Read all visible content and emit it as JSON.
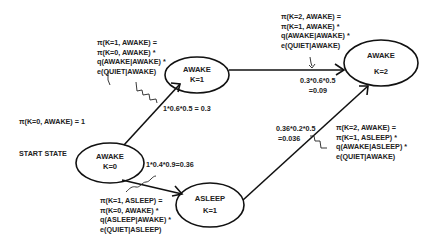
{
  "diagram": {
    "type": "hmm-trellis",
    "nodes": [
      {
        "id": "awake_k0",
        "state": "AWAKE",
        "step": "K=0"
      },
      {
        "id": "awake_k1",
        "state": "AWAKE",
        "step": "K=1"
      },
      {
        "id": "asleep_k1",
        "state": "ASLEEP",
        "step": "K=1"
      },
      {
        "id": "awake_k2",
        "state": "AWAKE",
        "step": "K=2"
      }
    ],
    "start": {
      "init_formula": "π(K=0, AWAKE) = 1",
      "label": "START STATE"
    },
    "edges": [
      {
        "from": "awake_k0",
        "to": "awake_k1",
        "value": "1*0.6*0.5 = 0.3"
      },
      {
        "from": "awake_k0",
        "to": "asleep_k1",
        "value": "1*0.4*0.9=0.36"
      },
      {
        "from": "awake_k1",
        "to": "awake_k2",
        "value_line1": "0.3*0.6*0.5",
        "value_line2": "=0.09"
      },
      {
        "from": "asleep_k1",
        "to": "awake_k2",
        "value_line1": "0.36*0.2*0.5",
        "value_line2": "=0.036"
      }
    ],
    "annotations": {
      "awake_k1": [
        "π(K=1, AWAKE) =",
        "π(K=0, AWAKE) *",
        "q(AWAKE|AWAKE) *",
        "e(QUIET|AWAKE)"
      ],
      "awake_k2_from_awake": [
        "π(K=2, AWAKE) =",
        "π(K=1, AWAKE) *",
        "q(AWAKE|AWAKE) *",
        "e(QUIET|AWAKE)"
      ],
      "asleep_k1": [
        "π(K=1, ASLEEP) =",
        "π(K=0, AWAKE) *",
        "q(ASLEEP|AWAKE) *",
        "e(QUIET|ASLEEP)"
      ],
      "awake_k2_from_asleep": [
        "π(K=2, AWAKE) =",
        "π(K=1, ASLEEP) *",
        "q(AWAKE|ASLEEP) *",
        "e(QUIET|AWAKE)"
      ]
    }
  }
}
